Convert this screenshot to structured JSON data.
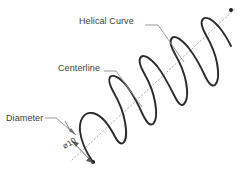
{
  "drawing": {
    "title": "Helical Curve Technical Drawing",
    "background_color": "#ffffff",
    "curve_color": "#2b2b2b",
    "centerline_color": "#9a9a9a",
    "leader_color": "#8c8c8c",
    "text_color": "#3c3c3c"
  },
  "annotations": {
    "helical_curve": {
      "label": "Helical Curve",
      "dash": "—"
    },
    "centerline": {
      "label": "Centerline",
      "dash": "—"
    },
    "diameter": {
      "label": "Diameter",
      "dash": "—"
    },
    "diameter_dimension": {
      "label": "ø10",
      "symbol": "ø",
      "value": "10"
    }
  },
  "geometry": {
    "helix": {
      "coil_count": 5,
      "axis_start": [
        75,
        158
      ],
      "axis_end": [
        232,
        10
      ],
      "radius_px": 30
    },
    "centerline_style": "dotted",
    "endpoint_markers": 2
  }
}
